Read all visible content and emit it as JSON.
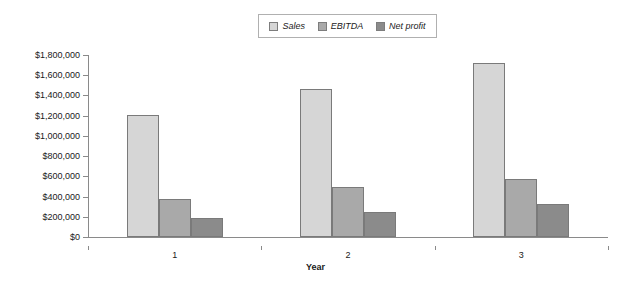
{
  "chart_data": {
    "type": "bar",
    "title": "",
    "xlabel": "Year",
    "ylabel": "",
    "categories": [
      "1",
      "2",
      "3"
    ],
    "series": [
      {
        "name": "Sales",
        "values": [
          1210000,
          1460000,
          1720000
        ],
        "color": "#d6d6d6"
      },
      {
        "name": "EBITDA",
        "values": [
          380000,
          490000,
          570000
        ],
        "color": "#a9a9a9"
      },
      {
        "name": "Net profit",
        "values": [
          190000,
          250000,
          330000
        ],
        "color": "#8b8b8b"
      }
    ],
    "ylim": [
      0,
      1800000
    ],
    "ytick_values": [
      0,
      200000,
      400000,
      600000,
      800000,
      1000000,
      1200000,
      1400000,
      1600000,
      1800000
    ],
    "ytick_labels": [
      "$0",
      "$200,000",
      "$400,000",
      "$600,000",
      "$800,000",
      "$1,000,000",
      "$1,200,000",
      "$1,400,000",
      "$1,600,000",
      "$1,800,000"
    ],
    "grid": false,
    "legend_position": "top-center",
    "bar_outline_color": "#7a7a7a"
  },
  "legend": {
    "entries": [
      {
        "label": "Sales"
      },
      {
        "label": "EBITDA"
      },
      {
        "label": "Net profit"
      }
    ]
  },
  "axis": {
    "x_title": "Year"
  }
}
